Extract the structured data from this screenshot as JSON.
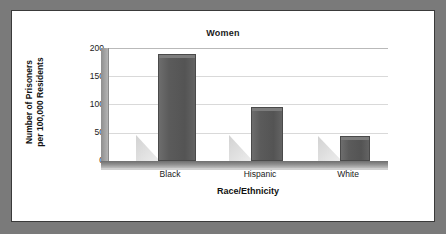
{
  "chart_data": {
    "type": "bar",
    "title": "Women",
    "xlabel": "Race/Ethnicity",
    "ylabel_line1": "Number of Prisoners",
    "ylabel_line2": "per 100,000 Residents",
    "categories": [
      "Black",
      "Hispanic",
      "White"
    ],
    "values": [
      190,
      95,
      45
    ],
    "ylim": [
      0,
      200
    ],
    "yticks": [
      200,
      150,
      100,
      50,
      0
    ],
    "grid": true,
    "legend": "none",
    "style": "3d-bar",
    "colors": {
      "bar": "#585858",
      "bar_edge": "#4a4a4a",
      "shadow": "#d8d8d8",
      "gridline": "#d9d9d9",
      "frame": "#7a7a7a",
      "panel": "#ffffff",
      "text": "#1a1a1a"
    }
  }
}
